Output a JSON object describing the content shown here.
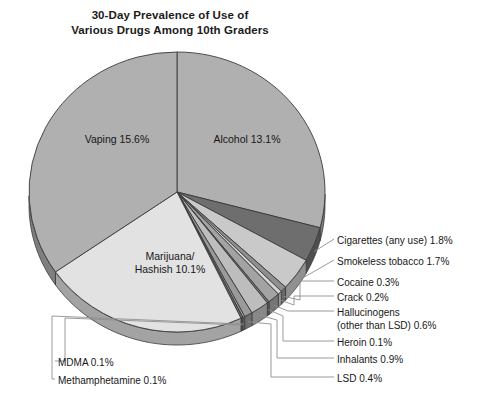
{
  "title": {
    "line1": "30-Day Prevalence of Use of",
    "line2": "Various Drugs Among 10th Graders"
  },
  "inside_labels": {
    "vaping": "Vaping 15.6%",
    "alcohol": "Alcohol 13.1%",
    "marijuana_l1": "Marijuana/",
    "marijuana_l2": "Hashish 10.1%"
  },
  "callouts": {
    "cigarettes": "Cigarettes (any use) 1.8%",
    "smokeless": "Smokeless tobacco 1.7%",
    "cocaine": "Cocaine 0.3%",
    "crack": "Crack 0.2%",
    "hallucinogens_l1": "Hallucinogens",
    "hallucinogens_l2": "(other than LSD) 0.6%",
    "heroin": "Heroin 0.1%",
    "inhalants": "Inhalants 0.9%",
    "lsd": "LSD 0.4%",
    "mdma": "MDMA 0.1%",
    "methamphetamine": "Methamphetamine 0.1%"
  },
  "colors": {
    "background": "#ffffff",
    "text": "#171717",
    "outline": "#3a3a3a",
    "leader": "#8e8e8e",
    "vaping_top": "#b0b0b0",
    "alcohol_top": "#b0b0b0",
    "marijuana_top": "#e2e2e2",
    "cigarettes_top": "#6e6e6e",
    "smokeless_top": "#c9c9c9",
    "cocaine_top": "#8f8f8f",
    "crack_top": "#d6d6d6",
    "hallucinogens_top": "#a3a3a3",
    "heroin_top": "#777777",
    "inhalants_top": "#bdbdbd",
    "lsd_top": "#9a9a9a",
    "mdma_top": "#6a6a6a",
    "meth_top": "#9f9f9f"
  },
  "chart_data": {
    "type": "pie",
    "title": "30-Day Prevalence of Use of Various Drugs Among 10th Graders",
    "value_unit": "percent",
    "three_d": true,
    "legend": "callout-labels",
    "categories": [
      "Alcohol",
      "Cigarettes (any use)",
      "Smokeless tobacco",
      "Cocaine",
      "Crack",
      "Hallucinogens (other than LSD)",
      "Heroin",
      "Inhalants",
      "LSD",
      "Methamphetamine",
      "MDMA",
      "Marijuana/Hashish",
      "Vaping"
    ],
    "values": [
      13.1,
      1.8,
      1.7,
      0.3,
      0.2,
      0.6,
      0.1,
      0.9,
      0.4,
      0.1,
      0.1,
      10.1,
      15.6
    ],
    "labels": [
      "Alcohol 13.1%",
      "Cigarettes (any use) 1.8%",
      "Smokeless tobacco 1.7%",
      "Cocaine 0.3%",
      "Crack 0.2%",
      "Hallucinogens (other than LSD) 0.6%",
      "Heroin 0.1%",
      "Inhalants 0.9%",
      "LSD 0.4%",
      "Methamphetamine 0.1%",
      "MDMA 0.1%",
      "Marijuana/Hashish 10.1%",
      "Vaping 15.6%"
    ],
    "total": 46.0,
    "xlabel": "",
    "ylabel": ""
  }
}
